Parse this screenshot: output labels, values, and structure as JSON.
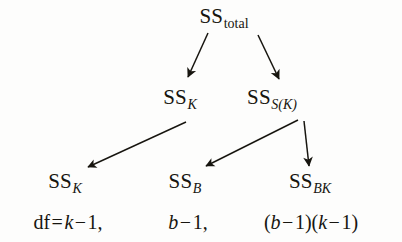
{
  "diagram": {
    "type": "variance-decomposition-tree",
    "background_color": "#fdfdfc",
    "ink_color": "#17150f",
    "levels": [
      {
        "level": 1,
        "nodes": [
          {
            "id": "ss-total",
            "base": "SS",
            "subscript": "total",
            "subscript_italic": false,
            "x": 224,
            "y": 18
          }
        ]
      },
      {
        "level": 2,
        "nodes": [
          {
            "id": "ss-k-mid",
            "base": "SS",
            "subscript": "K",
            "subscript_italic": true,
            "x": 180,
            "y": 99
          },
          {
            "id": "ss-s-k",
            "base": "SS",
            "subscript": "S(K)",
            "subscript_italic": true,
            "x": 272,
            "y": 99
          }
        ]
      },
      {
        "level": 3,
        "nodes": [
          {
            "id": "ss-k-bottom",
            "base": "SS",
            "subscript": "K",
            "subscript_italic": true,
            "x": 65,
            "y": 183
          },
          {
            "id": "ss-b",
            "base": "SS",
            "subscript": "B",
            "subscript_italic": true,
            "x": 185,
            "y": 183
          },
          {
            "id": "ss-bk",
            "base": "SS",
            "subscript": "BK",
            "subscript_italic": true,
            "x": 310,
            "y": 183
          }
        ]
      }
    ],
    "arrows": [
      {
        "id": "arrow-total-to-ssk",
        "from": "ss-total",
        "to": "ss-k-mid",
        "x1": 208,
        "y1": 33,
        "x2": 188,
        "y2": 77
      },
      {
        "id": "arrow-total-to-sssk",
        "from": "ss-total",
        "to": "ss-s-k",
        "x1": 258,
        "y1": 35,
        "x2": 279,
        "y2": 79
      },
      {
        "id": "arrow-ssk-to-ssk",
        "from": "ss-k-mid",
        "to": "ss-k-bottom",
        "x1": 186,
        "y1": 122,
        "x2": 87,
        "y2": 167
      },
      {
        "id": "arrow-sssk-to-ssb",
        "from": "ss-s-k",
        "to": "ss-b",
        "x1": 298,
        "y1": 120,
        "x2": 205,
        "y2": 166
      },
      {
        "id": "arrow-sssk-to-ssbk",
        "from": "ss-s-k",
        "to": "ss-bk",
        "x1": 305,
        "y1": 121,
        "x2": 309,
        "y2": 166
      }
    ],
    "df_row": {
      "label": "df",
      "equals": "=",
      "cells": [
        {
          "id": "df-k",
          "text": "df = k − 1,",
          "parts": [
            "df",
            "=",
            "k",
            "−",
            "1",
            ","
          ],
          "x": 68,
          "value": "k − 1"
        },
        {
          "id": "df-b",
          "text": "b − 1,",
          "parts": [
            "b",
            "−",
            "1",
            ","
          ],
          "x": 188,
          "value": "b − 1"
        },
        {
          "id": "df-bk",
          "text": "(b − 1)(k − 1)",
          "parts": [
            "(",
            "b",
            "−",
            "1",
            ")",
            "(",
            "k",
            "−",
            "1",
            ")"
          ],
          "x": 311,
          "value": "(b − 1)(k − 1)"
        }
      ]
    }
  },
  "text": {
    "ss": "SS",
    "sub_total": "total",
    "sub_k": "K",
    "sub_sk": "S(K)",
    "sub_b": "B",
    "sub_bk": "BK",
    "df_label": "df",
    "eq": "=",
    "minus": "−",
    "one": "1",
    "k": "k",
    "b": "b",
    "comma": ",",
    "lparen": "(",
    "rparen": ")"
  }
}
